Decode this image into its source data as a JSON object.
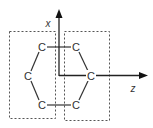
{
  "diagram": {
    "axes": {
      "vertical": {
        "label": "x"
      },
      "horizontal": {
        "label": "z"
      }
    },
    "atoms": [
      {
        "id": "c-top-left",
        "label": "C"
      },
      {
        "id": "c-top-right",
        "label": "C"
      },
      {
        "id": "c-left",
        "label": "C"
      },
      {
        "id": "c-right",
        "label": "C"
      },
      {
        "id": "c-bottom-left",
        "label": "C"
      },
      {
        "id": "c-bottom-right",
        "label": "C"
      }
    ],
    "groups": [
      {
        "id": "left-box",
        "style": "dashed"
      },
      {
        "id": "right-box",
        "style": "dashed"
      }
    ],
    "colors": {
      "stroke": "#333333",
      "dashed": "#555555",
      "background": "#ffffff"
    }
  }
}
